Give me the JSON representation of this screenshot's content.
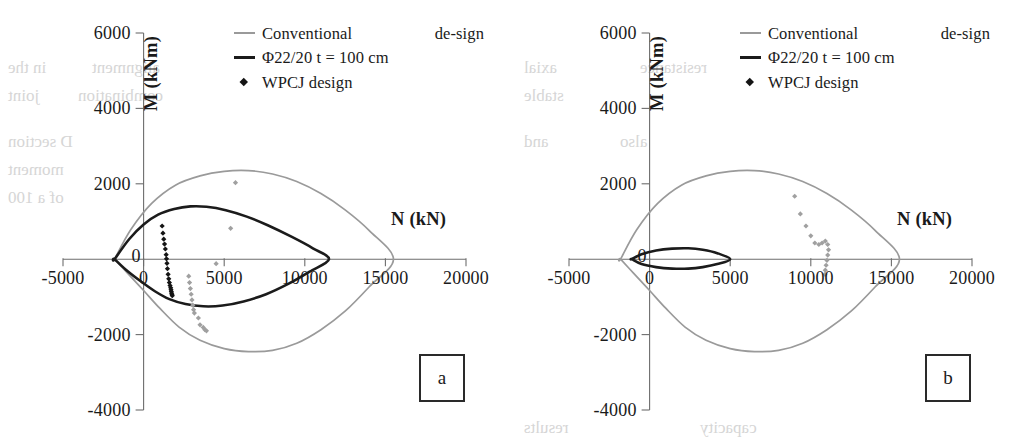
{
  "figure": {
    "background_color": "#ffffff",
    "series_colors": {
      "conventional_design": "#9a9a9a",
      "phi_design": "#1b1b1b",
      "wpcj_points_a": "#141414",
      "wpcj_points_gray": "#a0a0a0"
    },
    "axis_ticks": {
      "x": [
        "-5000",
        "0",
        "5000",
        "10000",
        "15000",
        "20000"
      ],
      "y": [
        "6000",
        "4000",
        "2000",
        "-2000",
        "-4000"
      ],
      "y_origin_label": "0"
    },
    "legend": [
      {
        "key": "line-gray",
        "label": "Conventional de-sign",
        "wrap": true
      },
      {
        "key": "line-black",
        "label": "Φ22/20  t = 100 cm",
        "wrap": false
      },
      {
        "key": "diamond",
        "label": "WPCJ design",
        "wrap": false
      }
    ],
    "panels": [
      {
        "tag": "a",
        "xlabel": "N (kN)",
        "ylabel": "M (kNm)"
      },
      {
        "tag": "b",
        "xlabel": "N (kN)",
        "ylabel": "M (kNm)"
      }
    ],
    "bleed_text": [
      {
        "x": 8,
        "y": 58,
        "text": "in the"
      },
      {
        "x": 92,
        "y": 58,
        "text": "alignment"
      },
      {
        "x": 8,
        "y": 86,
        "text": "joint"
      },
      {
        "x": 78,
        "y": 86,
        "text": "combination"
      },
      {
        "x": 8,
        "y": 132,
        "text": "D  section"
      },
      {
        "x": 8,
        "y": 160,
        "text": "moment"
      },
      {
        "x": 8,
        "y": 188,
        "text": "of a 100"
      },
      {
        "x": 524,
        "y": 58,
        "text": "axial"
      },
      {
        "x": 640,
        "y": 58,
        "text": "resistance"
      },
      {
        "x": 524,
        "y": 86,
        "text": "stable"
      },
      {
        "x": 524,
        "y": 132,
        "text": "and"
      },
      {
        "x": 620,
        "y": 132,
        "text": "also"
      },
      {
        "x": 524,
        "y": 418,
        "text": "results"
      },
      {
        "x": 700,
        "y": 418,
        "text": "capacity"
      }
    ]
  },
  "chart_data": [
    {
      "type": "line",
      "panel": "a",
      "title": "",
      "xlabel": "N (kN)",
      "ylabel": "M (kNm)",
      "xlim": [
        -5000,
        20000
      ],
      "ylim": [
        -4000,
        6000
      ],
      "grid": false,
      "legend_position": "top-right-inside",
      "series": [
        {
          "name": "Conventional design",
          "style": "line",
          "color": "#9a9a9a",
          "points": [
            [
              -1800,
              0
            ],
            [
              -800,
              780
            ],
            [
              500,
              1480
            ],
            [
              2000,
              1970
            ],
            [
              3500,
              2210
            ],
            [
              5000,
              2330
            ],
            [
              6500,
              2350
            ],
            [
              8000,
              2260
            ],
            [
              9500,
              2060
            ],
            [
              11000,
              1740
            ],
            [
              12500,
              1310
            ],
            [
              14000,
              760
            ],
            [
              15500,
              0
            ],
            [
              14000,
              -730
            ],
            [
              12500,
              -1380
            ],
            [
              11000,
              -1870
            ],
            [
              9500,
              -2230
            ],
            [
              8000,
              -2420
            ],
            [
              6500,
              -2450
            ],
            [
              5000,
              -2370
            ],
            [
              3500,
              -2150
            ],
            [
              2200,
              -1800
            ],
            [
              1000,
              -1300
            ],
            [
              0,
              -830
            ],
            [
              -1000,
              -370
            ],
            [
              -1800,
              0
            ]
          ]
        },
        {
          "name": "Φ22/20 t = 100 cm",
          "style": "line",
          "color": "#1b1b1b",
          "points": [
            [
              -1800,
              0
            ],
            [
              -900,
              530
            ],
            [
              0,
              920
            ],
            [
              900,
              1180
            ],
            [
              1900,
              1330
            ],
            [
              2900,
              1400
            ],
            [
              3900,
              1390
            ],
            [
              5100,
              1300
            ],
            [
              6400,
              1130
            ],
            [
              7700,
              900
            ],
            [
              9200,
              590
            ],
            [
              10500,
              290
            ],
            [
              11500,
              0
            ],
            [
              10300,
              -330
            ],
            [
              9000,
              -650
            ],
            [
              7600,
              -930
            ],
            [
              6200,
              -1120
            ],
            [
              4900,
              -1230
            ],
            [
              3700,
              -1250
            ],
            [
              2600,
              -1190
            ],
            [
              1600,
              -1060
            ],
            [
              700,
              -850
            ],
            [
              -200,
              -580
            ],
            [
              -1100,
              -280
            ],
            [
              -1800,
              0
            ]
          ]
        },
        {
          "name": "WPCJ design",
          "style": "scatter",
          "color": "#141414",
          "points": [
            [
              1150,
              880
            ],
            [
              1200,
              690
            ],
            [
              1250,
              530
            ],
            [
              1300,
              400
            ],
            [
              1350,
              270
            ],
            [
              1400,
              120
            ],
            [
              1420,
              10
            ],
            [
              1450,
              -110
            ],
            [
              1480,
              -250
            ],
            [
              1520,
              -400
            ],
            [
              1560,
              -520
            ],
            [
              1600,
              -620
            ],
            [
              1640,
              -700
            ],
            [
              1680,
              -760
            ],
            [
              1700,
              -810
            ],
            [
              1720,
              -860
            ],
            [
              1740,
              -900
            ],
            [
              1760,
              -940
            ],
            [
              1780,
              -970
            ]
          ]
        },
        {
          "name": "WPCJ design (faded)",
          "style": "scatter",
          "color": "#a0a0a0",
          "points": [
            [
              5700,
              2030
            ],
            [
              5400,
              820
            ],
            [
              4500,
              -120
            ],
            [
              2800,
              -450
            ],
            [
              2850,
              -620
            ],
            [
              2900,
              -780
            ],
            [
              2950,
              -930
            ],
            [
              3000,
              -1080
            ],
            [
              3050,
              -1220
            ],
            [
              3100,
              -1340
            ],
            [
              3150,
              -1430
            ],
            [
              3400,
              -1560
            ],
            [
              3500,
              -1740
            ],
            [
              3700,
              -1810
            ],
            [
              3800,
              -1870
            ],
            [
              3900,
              -1900
            ]
          ]
        }
      ]
    },
    {
      "type": "line",
      "panel": "b",
      "title": "",
      "xlabel": "N (kN)",
      "ylabel": "M (kNm)",
      "xlim": [
        -5000,
        20000
      ],
      "ylim": [
        -4000,
        6000
      ],
      "grid": false,
      "legend_position": "top-right-inside",
      "series": [
        {
          "name": "Conventional design",
          "style": "line",
          "color": "#9a9a9a",
          "points": [
            [
              -1800,
              0
            ],
            [
              -800,
              780
            ],
            [
              500,
              1480
            ],
            [
              2000,
              1970
            ],
            [
              3500,
              2210
            ],
            [
              5000,
              2330
            ],
            [
              6500,
              2350
            ],
            [
              8000,
              2260
            ],
            [
              9500,
              2060
            ],
            [
              11000,
              1740
            ],
            [
              12500,
              1310
            ],
            [
              14000,
              760
            ],
            [
              15500,
              0
            ],
            [
              14000,
              -730
            ],
            [
              12500,
              -1380
            ],
            [
              11000,
              -1870
            ],
            [
              9500,
              -2230
            ],
            [
              8000,
              -2420
            ],
            [
              6500,
              -2450
            ],
            [
              5000,
              -2370
            ],
            [
              3500,
              -2150
            ],
            [
              2200,
              -1800
            ],
            [
              1000,
              -1300
            ],
            [
              0,
              -830
            ],
            [
              -1000,
              -370
            ],
            [
              -1800,
              0
            ]
          ]
        },
        {
          "name": "Φ22/20 t = 100 cm",
          "style": "line",
          "color": "#1b1b1b",
          "points": [
            [
              -1100,
              0
            ],
            [
              -500,
              130
            ],
            [
              400,
              230
            ],
            [
              1400,
              280
            ],
            [
              2400,
              290
            ],
            [
              3300,
              250
            ],
            [
              4200,
              160
            ],
            [
              5000,
              0
            ],
            [
              4200,
              -130
            ],
            [
              3300,
              -210
            ],
            [
              2400,
              -250
            ],
            [
              1400,
              -250
            ],
            [
              400,
              -210
            ],
            [
              -500,
              -130
            ],
            [
              -1100,
              0
            ]
          ]
        },
        {
          "name": "WPCJ design",
          "style": "scatter",
          "color": "#a0a0a0",
          "points": [
            [
              9000,
              1670
            ],
            [
              9350,
              1200
            ],
            [
              9700,
              880
            ],
            [
              10000,
              620
            ],
            [
              10250,
              430
            ],
            [
              10500,
              390
            ],
            [
              10700,
              430
            ],
            [
              10900,
              480
            ],
            [
              11050,
              390
            ],
            [
              11100,
              250
            ],
            [
              11050,
              110
            ],
            [
              11000,
              -30
            ],
            [
              10950,
              -160
            ],
            [
              10900,
              -290
            ],
            [
              10880,
              -400
            ]
          ]
        }
      ]
    }
  ]
}
